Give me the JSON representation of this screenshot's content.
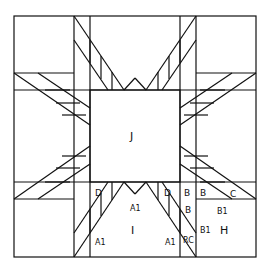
{
  "diagram": {
    "type": "quilt block pattern",
    "stroke_color": "#111111",
    "background": "#ffffff",
    "labels": {
      "center": "J",
      "bottom_triangle": "I",
      "corner": "H",
      "d_left": "D",
      "d_right": "D",
      "b_top1": "B",
      "b_top2": "B",
      "b_mid": "B",
      "c": "C",
      "b1_top": "B1",
      "b1_mid": "B1",
      "a1_center": "A1",
      "a1_left": "A1",
      "a1_right": "A1",
      "rc": "RC"
    }
  }
}
